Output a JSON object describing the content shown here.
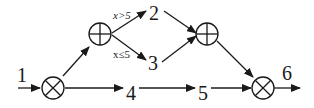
{
  "diagram": {
    "type": "flow-graph",
    "labels": {
      "n1": "1",
      "n2": "2",
      "n3": "3",
      "n4": "4",
      "n5": "5",
      "n6": "6"
    },
    "conditions": {
      "to_2": "x>5",
      "to_3": "x≤5"
    },
    "operators": {
      "left_and": "⊗ (multiply / AND join)",
      "top_or_split": "⊕ (XOR split)",
      "top_or_join": "⊕ (XOR join)",
      "right_and": "⊗ (multiply / AND join)"
    },
    "edges": [
      {
        "from": "1",
        "to": "AND-split"
      },
      {
        "from": "AND-split",
        "to": "XOR-split"
      },
      {
        "from": "AND-split",
        "to": "4"
      },
      {
        "from": "XOR-split",
        "to": "2",
        "label": "x>5"
      },
      {
        "from": "XOR-split",
        "to": "3",
        "label": "x≤5"
      },
      {
        "from": "2",
        "to": "XOR-join"
      },
      {
        "from": "3",
        "to": "XOR-join"
      },
      {
        "from": "4",
        "to": "5"
      },
      {
        "from": "XOR-join",
        "to": "AND-join"
      },
      {
        "from": "5",
        "to": "AND-join"
      },
      {
        "from": "AND-join",
        "to": "6"
      }
    ]
  }
}
